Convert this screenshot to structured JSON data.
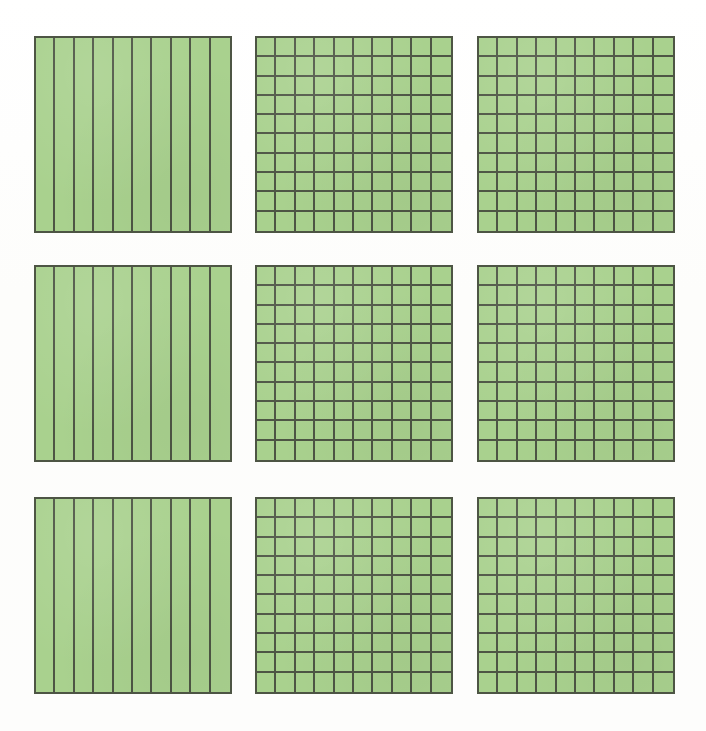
{
  "figure": {
    "background_color": "#fefefd",
    "fill_color": "#a9d18e",
    "line_color": "#4d5544",
    "rows": 3,
    "columns": 3,
    "total_squares": 9
  },
  "chart_data": {
    "type": "table",
    "xlabel": "",
    "ylabel": "",
    "categories": [
      "row1-col1",
      "row1-col2",
      "row1-col3",
      "row2-col1",
      "row2-col2",
      "row2-col3",
      "row3-col1",
      "row3-col2",
      "row3-col3"
    ],
    "values": [
      10,
      100,
      10,
      100,
      100,
      10,
      100,
      100,
      100
    ],
    "legend": [
      "tenths (10 vertical strips)",
      "hundredths (10 x 10 grid)"
    ]
  },
  "squares": [
    {
      "id": "square-r1c1",
      "label": "Row 1, Column 1",
      "pattern": "tenths",
      "cols": 10,
      "rows": 1,
      "parts": 10,
      "x": 34,
      "y": 36,
      "w": 198,
      "h": 197
    },
    {
      "id": "square-r1c2",
      "label": "Row 1, Column 2",
      "pattern": "hundredths",
      "cols": 10,
      "rows": 10,
      "parts": 100,
      "x": 255,
      "y": 36,
      "w": 198,
      "h": 197
    },
    {
      "id": "square-r1c3",
      "label": "Row 1, Column 3",
      "pattern": "hundredths",
      "cols": 10,
      "rows": 10,
      "parts": 100,
      "x": 477,
      "y": 36,
      "w": 198,
      "h": 197
    },
    {
      "id": "square-r2c1",
      "label": "Row 2, Column 1",
      "pattern": "tenths",
      "cols": 10,
      "rows": 1,
      "parts": 10,
      "x": 34,
      "y": 265,
      "w": 198,
      "h": 197
    },
    {
      "id": "square-r2c2",
      "label": "Row 2, Column 2",
      "pattern": "hundredths",
      "cols": 10,
      "rows": 10,
      "parts": 100,
      "x": 255,
      "y": 265,
      "w": 198,
      "h": 197
    },
    {
      "id": "square-r2c3",
      "label": "Row 2, Column 3",
      "pattern": "hundredths",
      "cols": 10,
      "rows": 10,
      "parts": 100,
      "x": 477,
      "y": 265,
      "w": 198,
      "h": 197
    },
    {
      "id": "square-r3c1",
      "label": "Row 3, Column 1",
      "pattern": "tenths",
      "cols": 10,
      "rows": 1,
      "parts": 10,
      "x": 34,
      "y": 497,
      "w": 198,
      "h": 197
    },
    {
      "id": "square-r3c2",
      "label": "Row 3, Column 2",
      "pattern": "hundredths",
      "cols": 10,
      "rows": 10,
      "parts": 100,
      "x": 255,
      "y": 497,
      "w": 198,
      "h": 197
    },
    {
      "id": "square-r3c3",
      "label": "Row 3, Column 3",
      "pattern": "hundredths",
      "cols": 10,
      "rows": 10,
      "parts": 100,
      "x": 477,
      "y": 497,
      "w": 198,
      "h": 197
    }
  ]
}
